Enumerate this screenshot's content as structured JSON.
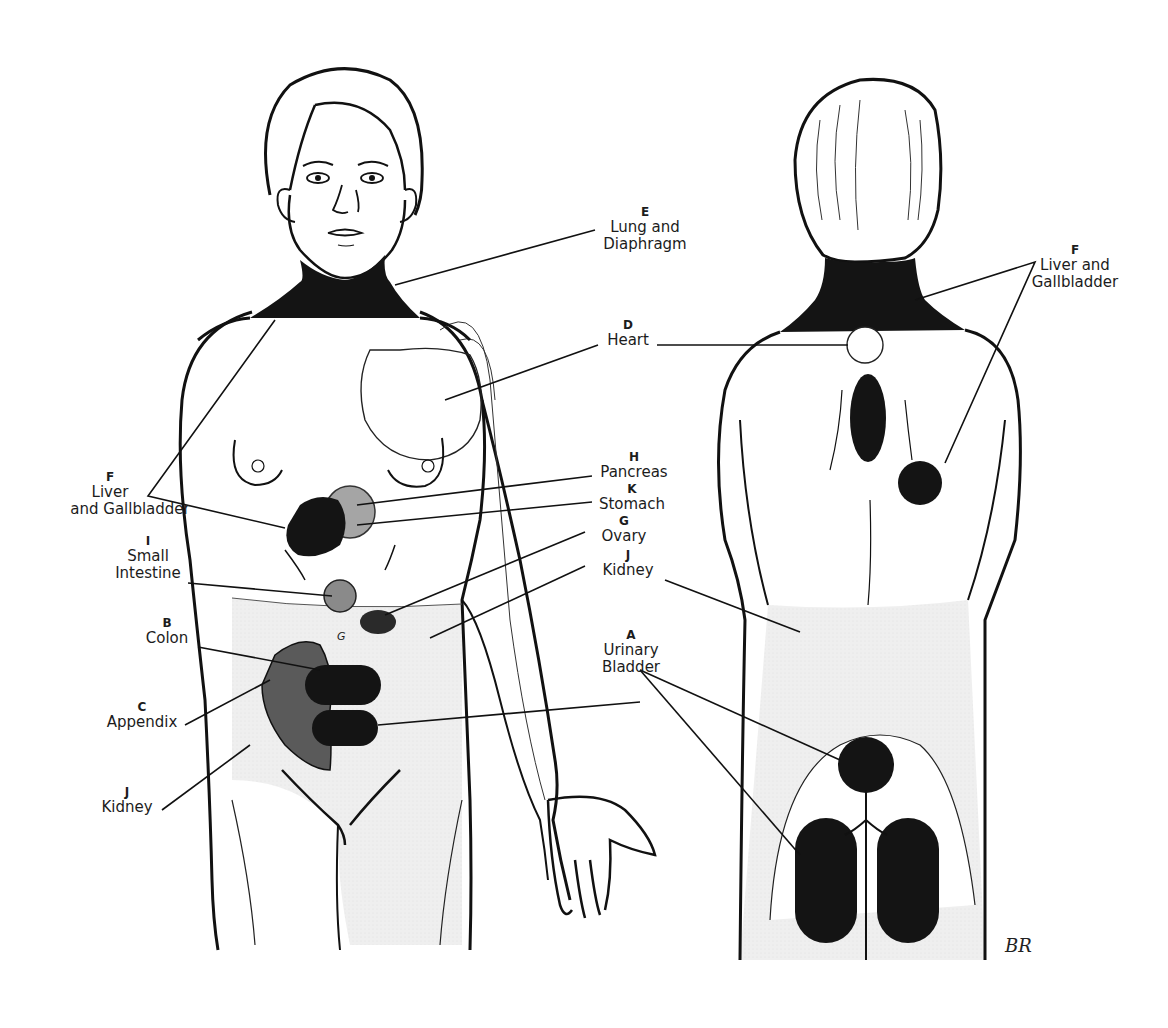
{
  "figure": {
    "views": [
      {
        "id": "front",
        "label": "Anterior view"
      },
      {
        "id": "back",
        "label": "Posterior view"
      }
    ],
    "colors": {
      "outline": "#111111",
      "dark_region": "#141414",
      "medium_region": "#555555",
      "light_region": "#a5a5a5",
      "shaded_skin": "#efefef",
      "background": "#ffffff"
    }
  },
  "labels": {
    "E": {
      "letter": "E",
      "name_line1": "Lung and",
      "name_line2": "Diaphragm"
    },
    "D": {
      "letter": "D",
      "name_line1": "Heart"
    },
    "F_front": {
      "letter": "F",
      "name_line1": "Liver",
      "name_line2": "and Gallbladder"
    },
    "I": {
      "letter": "I",
      "name_line1": "Small",
      "name_line2": "Intestine"
    },
    "H": {
      "letter": "H",
      "name_line1": "Pancreas"
    },
    "K": {
      "letter": "K",
      "name_line1": "Stomach"
    },
    "G": {
      "letter": "G",
      "name_line1": "Ovary"
    },
    "J_front_right": {
      "letter": "J",
      "name_line1": "Kidney"
    },
    "B": {
      "letter": "B",
      "name_line1": "Colon"
    },
    "C": {
      "letter": "C",
      "name_line1": "Appendix"
    },
    "J_front_left": {
      "letter": "J",
      "name_line1": "Kidney"
    },
    "A": {
      "letter": "A",
      "name_line1": "Urinary",
      "name_line2": "Bladder"
    },
    "F_back": {
      "letter": "F",
      "name_line1": "Liver and",
      "name_line2": "Gallbladder"
    }
  },
  "annotations": {
    "small_g_mark": "G",
    "signature": "BR"
  }
}
